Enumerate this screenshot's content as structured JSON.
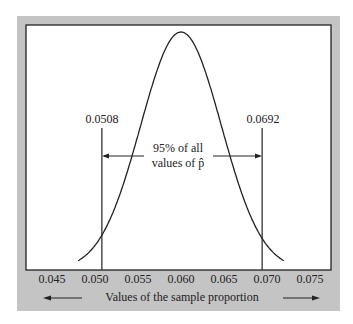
{
  "chart_data": {
    "type": "line",
    "title": "",
    "subtitle": "",
    "xlabel": "Values of the sample proportion",
    "ylabel": "",
    "distribution": "normal",
    "mean": 0.06,
    "std": 0.004694,
    "xlim": [
      0.0425,
      0.0775
    ],
    "x_ticks": [
      0.045,
      0.05,
      0.055,
      0.06,
      0.065,
      0.07,
      0.075
    ],
    "x_tick_labels": [
      "0.045",
      "0.050",
      "0.055",
      "0.060",
      "0.065",
      "0.070",
      "0.075"
    ],
    "grid": false,
    "legend": null,
    "vertical_lines": [
      {
        "x": 0.0508,
        "label": "0.0508"
      },
      {
        "x": 0.0692,
        "label": "0.0692"
      }
    ],
    "annotations": [
      {
        "text": "95% of all",
        "line": 1
      },
      {
        "text": "values of p̂",
        "line": 2
      }
    ],
    "interval_coverage": 0.95
  },
  "labels": {
    "left_bound": "0.0508",
    "right_bound": "0.0692",
    "annotation_line1": "95% of all",
    "annotation_line2": "values of p̂",
    "axis_caption": "Values of the sample proportion",
    "ticks": [
      "0.045",
      "0.050",
      "0.055",
      "0.060",
      "0.065",
      "0.070",
      "0.075"
    ]
  },
  "colors": {
    "frame": "#c4c4c4",
    "plot_bg": "#ffffff",
    "ink": "#222222"
  }
}
